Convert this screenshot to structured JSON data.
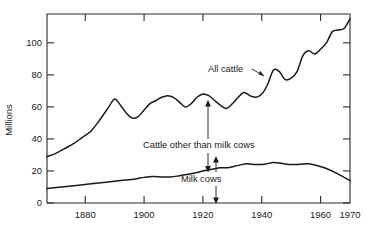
{
  "chart_data": {
    "type": "line",
    "title": "",
    "xlabel": "",
    "ylabel": "Millions",
    "xlim": [
      1867,
      1970
    ],
    "ylim": [
      0,
      118
    ],
    "grid": false,
    "legend_position": "inline-annotations",
    "x_ticks": [
      1880,
      1900,
      1920,
      1940,
      1960,
      1970
    ],
    "x_tick_labels": [
      "1880",
      "1900",
      "1920",
      "1940",
      "1960",
      "1970"
    ],
    "y_ticks": [
      0,
      20,
      40,
      60,
      80,
      100
    ],
    "y_tick_labels": [
      "0",
      "20",
      "40",
      "60",
      "80",
      "100"
    ],
    "annotations": [
      {
        "text": "All cattle",
        "x": 1931,
        "y": 74,
        "kind": "leader-label"
      },
      {
        "text": "Cattle other than milk cows",
        "x": 1908,
        "y": 40,
        "kind": "gap-label-upper"
      },
      {
        "text": "Milk cows",
        "x": 1921,
        "y": 14,
        "kind": "gap-label-lower"
      }
    ],
    "series": [
      {
        "name": "All cattle",
        "color": "#1a1a1a",
        "x": [
          1867,
          1870,
          1873,
          1876,
          1879,
          1882,
          1885,
          1888,
          1890,
          1892,
          1894,
          1896,
          1898,
          1900,
          1902,
          1904,
          1906,
          1908,
          1910,
          1912,
          1914,
          1916,
          1918,
          1920,
          1922,
          1924,
          1926,
          1928,
          1930,
          1932,
          1934,
          1936,
          1938,
          1940,
          1942,
          1944,
          1946,
          1948,
          1950,
          1952,
          1954,
          1956,
          1958,
          1960,
          1962,
          1964,
          1966,
          1968,
          1970
        ],
        "y": [
          29,
          31,
          34,
          37,
          41,
          45,
          52,
          60,
          65,
          61,
          56,
          53,
          54,
          58,
          62,
          64,
          66,
          67,
          66,
          63,
          60,
          62,
          66,
          68,
          67,
          64,
          61,
          59,
          62,
          66,
          69,
          67,
          66,
          68,
          74,
          83,
          82,
          77,
          78,
          82,
          92,
          95,
          93,
          96,
          100,
          107,
          108,
          109,
          115
        ]
      },
      {
        "name": "Milk cows",
        "color": "#1a1a1a",
        "x": [
          1867,
          1872,
          1877,
          1882,
          1887,
          1892,
          1897,
          1900,
          1903,
          1906,
          1909,
          1912,
          1915,
          1918,
          1920,
          1923,
          1926,
          1929,
          1932,
          1935,
          1938,
          1941,
          1944,
          1947,
          1950,
          1953,
          1956,
          1959,
          1962,
          1965,
          1968,
          1970
        ],
        "y": [
          9,
          10,
          11,
          12,
          13,
          14,
          15,
          16,
          16.6,
          16.3,
          16.2,
          17,
          18,
          19,
          20,
          21,
          22,
          22.2,
          23.5,
          24.5,
          24,
          24.2,
          25.3,
          24.7,
          24,
          24.2,
          24.5,
          23.2,
          21.5,
          19,
          16,
          14
        ]
      }
    ]
  }
}
